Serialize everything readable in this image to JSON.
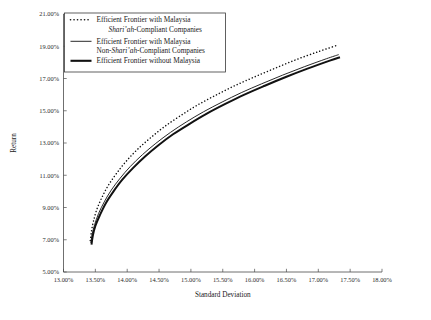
{
  "chart_data": {
    "type": "line",
    "title": "",
    "xlabel": "Standard Deviation",
    "ylabel": "Return",
    "xlim": [
      13.0,
      18.0
    ],
    "ylim": [
      5.0,
      21.0
    ],
    "grid": false,
    "legend_position": "top-left",
    "xtick_labels": [
      "13.00%",
      "13.50%",
      "14.00%",
      "14.50%",
      "15.00%",
      "15.50%",
      "16.00%",
      "16.50%",
      "17.00%",
      "17.50%",
      "18.00%"
    ],
    "xtick_values": [
      13.0,
      13.5,
      14.0,
      14.5,
      15.0,
      15.5,
      16.0,
      16.5,
      17.0,
      17.5,
      18.0
    ],
    "ytick_labels": [
      "5.00%",
      "7.00%",
      "9.00%",
      "11.00%",
      "13.00%",
      "15.00%",
      "17.00%",
      "19.00%",
      "21.00%"
    ],
    "ytick_values": [
      5,
      7,
      9,
      11,
      13,
      15,
      17,
      19,
      21
    ],
    "series": [
      {
        "name": "Efficient Frontier with Malaysia Shari'ah-Compliant Companies",
        "style": "dotted",
        "x": [
          13.42,
          13.44,
          13.47,
          13.52,
          13.6,
          13.7,
          13.83,
          13.98,
          14.16,
          14.36,
          14.58,
          14.82,
          15.08,
          15.36,
          15.66,
          15.97,
          16.3,
          16.64,
          16.99,
          17.29
        ],
        "y": [
          6.95,
          7.55,
          8.15,
          8.85,
          9.6,
          10.35,
          11.1,
          11.85,
          12.6,
          13.3,
          14.0,
          14.65,
          15.3,
          15.9,
          16.5,
          17.05,
          17.6,
          18.15,
          18.65,
          19.05
        ]
      },
      {
        "name": "Efficient Frontier with Malaysia Non-Shari'ah-Compliant Companies",
        "style": "thin-solid",
        "x": [
          13.43,
          13.45,
          13.49,
          13.55,
          13.64,
          13.75,
          13.89,
          14.05,
          14.24,
          14.45,
          14.68,
          14.93,
          15.2,
          15.49,
          15.79,
          16.11,
          16.44,
          16.78,
          17.13,
          17.32
        ],
        "y": [
          6.8,
          7.35,
          7.95,
          8.62,
          9.35,
          10.08,
          10.82,
          11.55,
          12.28,
          12.98,
          13.66,
          14.31,
          14.94,
          15.54,
          16.12,
          16.67,
          17.21,
          17.73,
          18.23,
          18.48
        ]
      },
      {
        "name": "Efficient Frontier without Malaysia",
        "style": "thick-solid",
        "x": [
          13.44,
          13.46,
          13.5,
          13.57,
          13.66,
          13.78,
          13.92,
          14.09,
          14.28,
          14.49,
          14.72,
          14.98,
          15.25,
          15.54,
          15.84,
          16.16,
          16.49,
          16.83,
          17.18,
          17.34
        ],
        "y": [
          6.7,
          7.25,
          7.85,
          8.52,
          9.24,
          9.97,
          10.71,
          11.44,
          12.16,
          12.86,
          13.54,
          14.19,
          14.82,
          15.42,
          16.0,
          16.55,
          17.09,
          17.61,
          18.11,
          18.32
        ]
      }
    ]
  },
  "legend": {
    "entries": [
      {
        "line1": "Efficient Frontier with Malaysia",
        "line2_pre": "",
        "line2_italic": "Shari’ah",
        "line2_post": "-Compliant Companies"
      },
      {
        "line1": "Efficient Frontier with Malaysia",
        "line2_pre": "Non-",
        "line2_italic": "Shari’ah",
        "line2_post": "-Compliant Companies"
      },
      {
        "line1": "Efficient Frontier without Malaysia",
        "line2_pre": "",
        "line2_italic": "",
        "line2_post": ""
      }
    ]
  },
  "axes": {
    "x_title": "Standard Deviation",
    "y_title": "Return"
  }
}
